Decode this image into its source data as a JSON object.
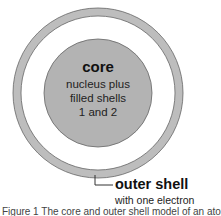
{
  "diagram": {
    "core": {
      "title": "core",
      "description_lines": [
        "nucleus plus",
        "filled shells",
        "1 and 2"
      ]
    },
    "outer_shell": {
      "label": "outer shell",
      "sublabel": "with one electron"
    },
    "caption": "Figure 1 The core and outer shell model of an atom",
    "colors": {
      "core_fill": "#b3b3b3",
      "shell_fill": "#bdbdbd",
      "outline": "#555555",
      "background": "#ffffff"
    }
  }
}
